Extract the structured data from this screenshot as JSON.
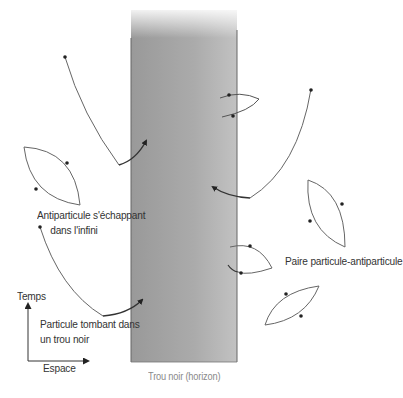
{
  "diagram": {
    "black_hole_label": "Trou noir (horizon)",
    "pair_label": "Paire particule-antiparticule",
    "escaping_label_line1": "Antiparticule s'échappant",
    "escaping_label_line2": "dans l'infini",
    "falling_label_line1": "Particule tombant dans",
    "falling_label_line2": "un trou noir",
    "axis": {
      "y_label": "Temps",
      "x_label": "Espace"
    },
    "colors": {
      "black_hole_dark": "#9c9c9c",
      "black_hole_light": "#bdbdbd",
      "line": "#555555",
      "text": "#333333"
    }
  }
}
